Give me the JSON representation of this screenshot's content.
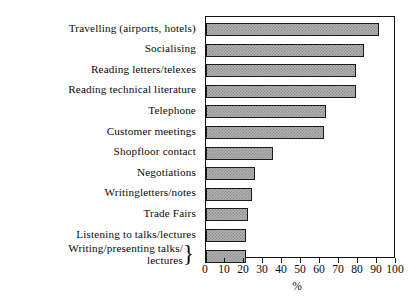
{
  "chart_data": {
    "type": "bar",
    "orientation": "horizontal",
    "title": "",
    "xlabel": "%",
    "ylabel": "",
    "xlim": [
      0,
      100
    ],
    "xticks": [
      0,
      10,
      20,
      30,
      40,
      50,
      60,
      70,
      80,
      90,
      100
    ],
    "grid": false,
    "legend": null,
    "categories": [
      "Travelling  (airports, hotels)",
      "Socialising",
      "Reading  letters/telexes",
      "Reading technical literature",
      "Telephone",
      "Customer meetings",
      "Shopfloor  contact",
      "Negotiations",
      "Writingletters/notes",
      "Trade  Fairs",
      "Listening to talks/lectures",
      "Writing/presenting talks/ lectures"
    ],
    "values": [
      91,
      83,
      79,
      79,
      63,
      62,
      35,
      26,
      24,
      22,
      21,
      21
    ],
    "series": [
      {
        "name": "Percentage",
        "values": [
          91,
          83,
          79,
          79,
          63,
          62,
          35,
          26,
          24,
          22,
          21,
          21
        ]
      }
    ]
  },
  "labels": {
    "items": [
      {
        "line1": "Travelling  (airports, hotels)",
        "line2": "",
        "brace": false
      },
      {
        "line1": "Socialising",
        "line2": "",
        "brace": false
      },
      {
        "line1": "Reading  letters/telexes",
        "line2": "",
        "brace": false
      },
      {
        "line1": "Reading technical literature",
        "line2": "",
        "brace": false
      },
      {
        "line1": "Telephone",
        "line2": "",
        "brace": false
      },
      {
        "line1": "Customer meetings",
        "line2": "",
        "brace": false
      },
      {
        "line1": "Shopfloor  contact",
        "line2": "",
        "brace": false
      },
      {
        "line1": "Negotiations",
        "line2": "",
        "brace": false
      },
      {
        "line1": "Writingletters/notes",
        "line2": "",
        "brace": false
      },
      {
        "line1": "Trade  Fairs",
        "line2": "",
        "brace": false
      },
      {
        "line1": "Listening to talks/lectures",
        "line2": "",
        "brace": false
      },
      {
        "line1": "Writing/presenting talks/",
        "line2": "lectures",
        "brace": true
      }
    ],
    "brace_glyph": "}"
  },
  "axis": {
    "tick_labels": [
      "0",
      "10",
      "20",
      "30",
      "40",
      "50",
      "60",
      "70",
      "80",
      "90",
      "100"
    ],
    "unit_label": "%"
  },
  "colors": {
    "bar_fill": "#b3b3b3",
    "bar_pattern": "#8d8d8d",
    "bar_outline": "#1a1a1a",
    "frame": "#111111",
    "text": "#0a0a0a",
    "background": "#ffffff"
  }
}
